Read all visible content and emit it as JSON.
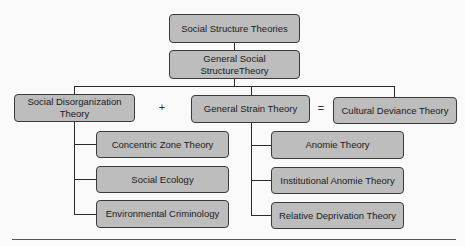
{
  "diagram": {
    "root": "Social Structure Theories",
    "general": "General Social StructureTheory",
    "left": {
      "title": "Social Disorganization Theory",
      "children": [
        "Concentric Zone Theory",
        "Social Ecology",
        "Environmental Criminology"
      ]
    },
    "middle": {
      "title": "General Strain Theory",
      "children": [
        "Anomie Theory",
        "Institutional Anomie Theory",
        "Relative Deprivation Theory"
      ]
    },
    "right": {
      "title": "Cultural Deviance Theory"
    },
    "operators": {
      "plus": "+",
      "equals": "="
    }
  }
}
